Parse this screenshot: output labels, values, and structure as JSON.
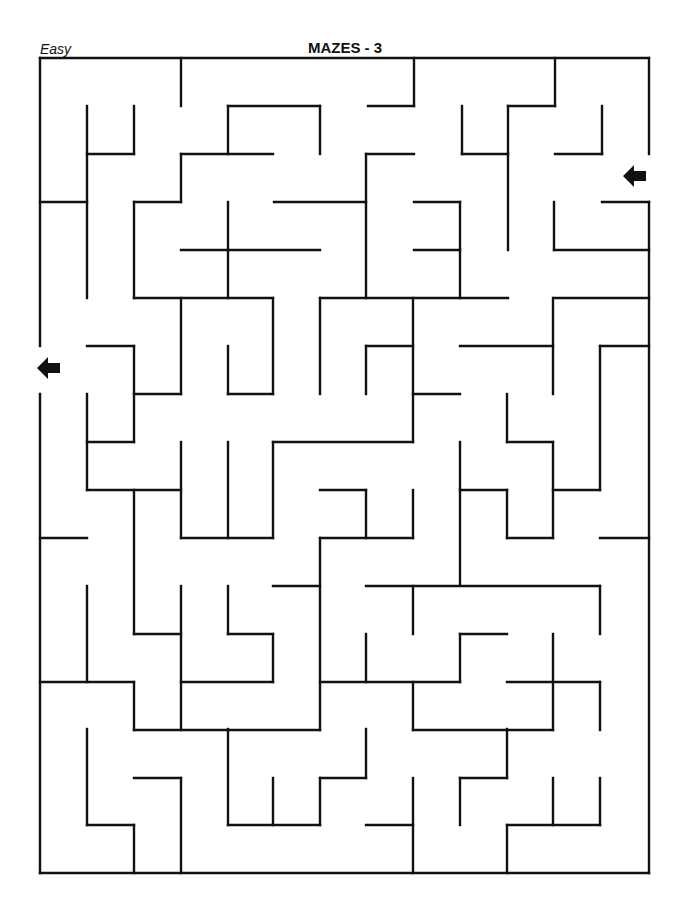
{
  "header": {
    "level": "Easy",
    "title": "MAZES - 3"
  },
  "maze": {
    "stroke_color": "#111111",
    "entrance": {
      "label": "entrance-arrow",
      "direction": "left",
      "x": 634,
      "y": 176
    },
    "exit": {
      "label": "exit-arrow",
      "direction": "left",
      "x": 48,
      "y": 368
    },
    "walls": [
      [
        40,
        58,
        649,
        58
      ],
      [
        40,
        58,
        40,
        346
      ],
      [
        40,
        394,
        40,
        873
      ],
      [
        40,
        873,
        649,
        873
      ],
      [
        649,
        58,
        649,
        154
      ],
      [
        649,
        202,
        649,
        873
      ],
      [
        181,
        58,
        181,
        106
      ],
      [
        414,
        58,
        414,
        106
      ],
      [
        368,
        106,
        414,
        106
      ],
      [
        555,
        58,
        555,
        106
      ],
      [
        508,
        106,
        555,
        106
      ],
      [
        87,
        106,
        87,
        298
      ],
      [
        134,
        106,
        134,
        154
      ],
      [
        87,
        154,
        134,
        154
      ],
      [
        228,
        106,
        320,
        106
      ],
      [
        228,
        106,
        228,
        154
      ],
      [
        320,
        106,
        320,
        154
      ],
      [
        181,
        154,
        273,
        154
      ],
      [
        181,
        154,
        181,
        202
      ],
      [
        134,
        202,
        181,
        202
      ],
      [
        134,
        202,
        134,
        298
      ],
      [
        40,
        202,
        87,
        202
      ],
      [
        274,
        202,
        366,
        202
      ],
      [
        366,
        154,
        414,
        154
      ],
      [
        366,
        154,
        366,
        298
      ],
      [
        228,
        202,
        228,
        298
      ],
      [
        181,
        250,
        320,
        250
      ],
      [
        134,
        298,
        273,
        298
      ],
      [
        320,
        298,
        508,
        298
      ],
      [
        462,
        106,
        462,
        154
      ],
      [
        462,
        154,
        508,
        154
      ],
      [
        508,
        106,
        508,
        250
      ],
      [
        602,
        106,
        602,
        154
      ],
      [
        555,
        154,
        602,
        154
      ],
      [
        414,
        202,
        460,
        202
      ],
      [
        460,
        202,
        460,
        298
      ],
      [
        414,
        250,
        460,
        250
      ],
      [
        554,
        202,
        554,
        250
      ],
      [
        554,
        250,
        649,
        250
      ],
      [
        602,
        202,
        649,
        202
      ],
      [
        554,
        298,
        649,
        298
      ],
      [
        181,
        298,
        181,
        394
      ],
      [
        134,
        394,
        181,
        394
      ],
      [
        87,
        346,
        134,
        346
      ],
      [
        134,
        346,
        134,
        442
      ],
      [
        87,
        442,
        134,
        442
      ],
      [
        87,
        394,
        87,
        490
      ],
      [
        228,
        346,
        228,
        394
      ],
      [
        228,
        394,
        273,
        394
      ],
      [
        273,
        298,
        273,
        394
      ],
      [
        320,
        298,
        320,
        394
      ],
      [
        273,
        442,
        413,
        442
      ],
      [
        273,
        442,
        273,
        538
      ],
      [
        181,
        442,
        181,
        538
      ],
      [
        228,
        442,
        228,
        538
      ],
      [
        181,
        538,
        273,
        538
      ],
      [
        87,
        490,
        181,
        490
      ],
      [
        134,
        490,
        134,
        634
      ],
      [
        40,
        538,
        87,
        538
      ],
      [
        413,
        298,
        413,
        442
      ],
      [
        366,
        346,
        413,
        346
      ],
      [
        366,
        346,
        366,
        394
      ],
      [
        413,
        394,
        460,
        394
      ],
      [
        553,
        298,
        553,
        394
      ],
      [
        460,
        346,
        553,
        346
      ],
      [
        600,
        346,
        649,
        346
      ],
      [
        600,
        346,
        600,
        490
      ],
      [
        553,
        490,
        600,
        490
      ],
      [
        507,
        394,
        507,
        442
      ],
      [
        507,
        442,
        553,
        442
      ],
      [
        553,
        442,
        553,
        538
      ],
      [
        507,
        538,
        553,
        538
      ],
      [
        507,
        490,
        507,
        538
      ],
      [
        460,
        490,
        507,
        490
      ],
      [
        460,
        442,
        460,
        585
      ],
      [
        320,
        490,
        366,
        490
      ],
      [
        366,
        490,
        366,
        538
      ],
      [
        413,
        490,
        413,
        538
      ],
      [
        320,
        538,
        413,
        538
      ],
      [
        600,
        538,
        649,
        538
      ],
      [
        134,
        634,
        181,
        634
      ],
      [
        87,
        586,
        87,
        682
      ],
      [
        40,
        682,
        134,
        682
      ],
      [
        134,
        682,
        134,
        730
      ],
      [
        181,
        586,
        181,
        730
      ],
      [
        181,
        682,
        273,
        682
      ],
      [
        273,
        634,
        273,
        682
      ],
      [
        228,
        634,
        273,
        634
      ],
      [
        228,
        586,
        228,
        634
      ],
      [
        320,
        538,
        320,
        730
      ],
      [
        273,
        586,
        320,
        586
      ],
      [
        134,
        730,
        320,
        730
      ],
      [
        366,
        586,
        600,
        586
      ],
      [
        413,
        586,
        413,
        634
      ],
      [
        600,
        586,
        600,
        634
      ],
      [
        366,
        634,
        366,
        682
      ],
      [
        320,
        682,
        460,
        682
      ],
      [
        460,
        634,
        460,
        682
      ],
      [
        460,
        634,
        507,
        634
      ],
      [
        553,
        634,
        553,
        730
      ],
      [
        507,
        682,
        600,
        682
      ],
      [
        600,
        682,
        600,
        730
      ],
      [
        413,
        682,
        413,
        730
      ],
      [
        413,
        730,
        553,
        730
      ],
      [
        87,
        729,
        87,
        825
      ],
      [
        87,
        825,
        134,
        825
      ],
      [
        134,
        825,
        134,
        873
      ],
      [
        134,
        778,
        181,
        778
      ],
      [
        181,
        778,
        181,
        873
      ],
      [
        228,
        729,
        228,
        825
      ],
      [
        228,
        825,
        320,
        825
      ],
      [
        273,
        778,
        273,
        825
      ],
      [
        320,
        778,
        320,
        825
      ],
      [
        320,
        778,
        366,
        778
      ],
      [
        366,
        729,
        366,
        778
      ],
      [
        413,
        778,
        413,
        873
      ],
      [
        366,
        825,
        413,
        825
      ],
      [
        507,
        729,
        507,
        778
      ],
      [
        460,
        778,
        507,
        778
      ],
      [
        460,
        778,
        460,
        825
      ],
      [
        507,
        825,
        507,
        873
      ],
      [
        507,
        825,
        600,
        825
      ],
      [
        553,
        778,
        553,
        825
      ],
      [
        600,
        778,
        600,
        825
      ]
    ]
  }
}
